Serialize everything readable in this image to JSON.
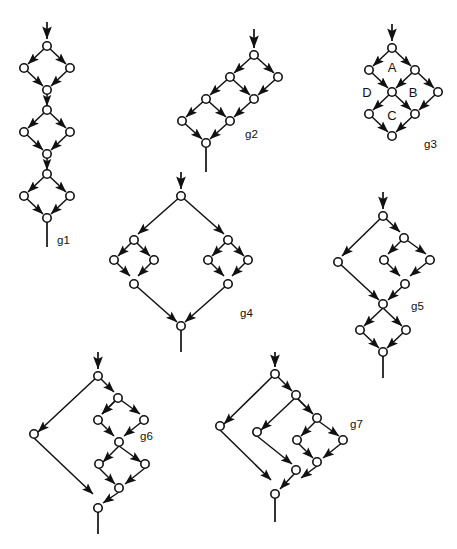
{
  "figure": {
    "width": 457,
    "height": 549,
    "background": "#ffffff",
    "ink_color": "#111111",
    "node_fill": "#ffffff",
    "node_radius": 4.2,
    "graph_count": 7,
    "labels": [
      {
        "id": "g1",
        "text": "g1",
        "x": 57,
        "y": 232
      },
      {
        "id": "g2",
        "text": "g2",
        "x": 245,
        "y": 134
      },
      {
        "id": "g3",
        "text": "g3",
        "x": 428,
        "y": 146
      },
      {
        "id": "g4",
        "text": "g4",
        "x": 242,
        "y": 313
      },
      {
        "id": "g5",
        "text": "g5",
        "x": 415,
        "y": 306
      },
      {
        "id": "g6",
        "text": "g6",
        "x": 146,
        "y": 436
      },
      {
        "id": "g7",
        "text": "g7",
        "x": 352,
        "y": 424
      }
    ],
    "face_labels": [
      {
        "text": "A",
        "x": 392,
        "y": 68,
        "graph": "g3"
      },
      {
        "text": "B",
        "x": 412,
        "y": 95,
        "graph": "g3"
      },
      {
        "text": "C",
        "x": 391,
        "y": 120,
        "graph": "g3"
      },
      {
        "text": "D",
        "x": 368,
        "y": 95,
        "graph": "g3"
      }
    ]
  },
  "graphs": [
    {
      "id": "g1",
      "name": "g1",
      "description": "Series composition of three diamonds stacked vertically.",
      "structure": "series of 3 parallel (diamond) blocks",
      "node_count": 10,
      "nodes": [
        {
          "id": "n1",
          "x": 47,
          "y": 46
        },
        {
          "id": "n2",
          "x": 24,
          "y": 68
        },
        {
          "id": "n3",
          "x": 70,
          "y": 68
        },
        {
          "id": "n4",
          "x": 47,
          "y": 90
        },
        {
          "id": "n5",
          "x": 47,
          "y": 110
        },
        {
          "id": "n6",
          "x": 24,
          "y": 132
        },
        {
          "id": "n7",
          "x": 70,
          "y": 132
        },
        {
          "id": "n8",
          "x": 47,
          "y": 154
        },
        {
          "id": "n9",
          "x": 24,
          "y": 176
        },
        {
          "id": "n10",
          "x": 70,
          "y": 176
        }
      ],
      "extra_nodes": [
        {
          "id": "n0b",
          "x": 47,
          "y": 132
        },
        {
          "id": "n11",
          "x": 47,
          "y": 198
        }
      ],
      "edges": [
        [
          "n1",
          "n2"
        ],
        [
          "n1",
          "n3"
        ],
        [
          "n2",
          "n4"
        ],
        [
          "n3",
          "n4"
        ],
        [
          "n4",
          "n5"
        ],
        [
          "n5",
          "n6"
        ],
        [
          "n5",
          "n7"
        ],
        [
          "n6",
          "n8"
        ],
        [
          "n7",
          "n8"
        ],
        [
          "n8",
          "n9"
        ],
        [
          "n8",
          "n10"
        ]
      ],
      "input_stub": {
        "x": 47,
        "y1": 22,
        "y2": 42,
        "arrow": true
      },
      "output_stub": {
        "x": 47,
        "y1": 202,
        "y2": 228,
        "arrow": false
      }
    },
    {
      "id": "g2",
      "name": "g2",
      "description": "Diagonal ladder: three diamonds chained along a down-left diagonal.",
      "structure": "diagonal chain of 3 diamonds sharing vertices",
      "node_count": 8,
      "input_stub": {
        "arrow": true
      },
      "output_stub": {
        "arrow": false
      }
    },
    {
      "id": "g3",
      "name": "g3",
      "description": "Two-by-two diamond lattice with four interior faces labelled A, B, C, D.",
      "structure": "lattice with 4 faces",
      "node_count": 9,
      "face_names": [
        "A",
        "B",
        "C",
        "D"
      ],
      "input_stub": {
        "arrow": true
      },
      "output_stub": {
        "arrow": false
      }
    },
    {
      "id": "g4",
      "name": "g4",
      "description": "Large diamond whose left and right branches each contain a small diamond.",
      "structure": "parallel of two series-parallel branches",
      "node_count": 12,
      "input_stub": {
        "arrow": true
      },
      "output_stub": {
        "arrow": false
      }
    },
    {
      "id": "g5",
      "name": "g5",
      "description": "Diamond containing a nested diamond on its right branch, in series with a final diamond.",
      "structure": "parallel block in series with a diamond",
      "node_count": 11,
      "input_stub": {
        "arrow": true
      },
      "output_stub": {
        "arrow": false
      }
    },
    {
      "id": "g6",
      "name": "g6",
      "description": "Outer diamond with a long left branch; right branch holds two diamonds in series.",
      "structure": "parallel of single arc and series of 2 diamonds",
      "node_count": 12,
      "input_stub": {
        "arrow": true
      },
      "output_stub": {
        "arrow": false
      }
    },
    {
      "id": "g7",
      "name": "g7",
      "description": "Three concentrically nested diamonds sharing the source-sink diagonal.",
      "structure": "nested parallel composition, depth 3",
      "node_count": 12,
      "input_stub": {
        "arrow": true
      },
      "output_stub": {
        "arrow": false
      }
    }
  ]
}
